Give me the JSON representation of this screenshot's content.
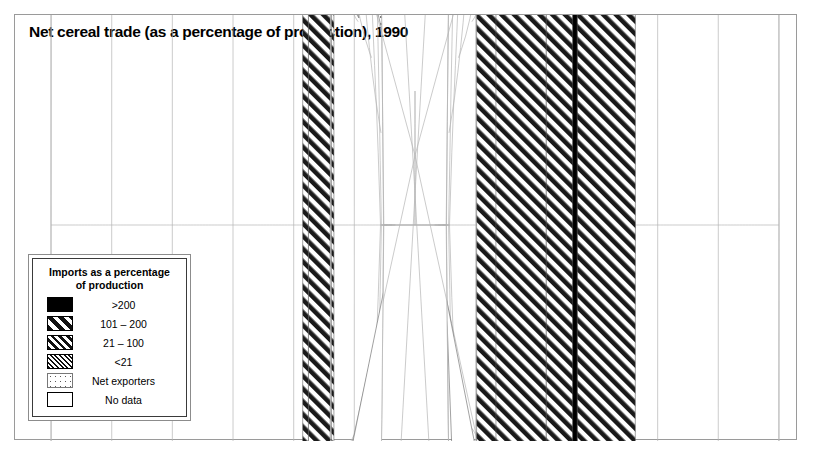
{
  "title": "Net cereal trade (as a percentage of production), 1990",
  "legend": {
    "heading_line1": "Imports as a percentage",
    "heading_line2": "of production",
    "items": [
      {
        "label": ">200",
        "pattern": "solid"
      },
      {
        "label": "101 – 200",
        "pattern": "hatch-wide"
      },
      {
        "label": "21 – 100",
        "pattern": "hatch-med"
      },
      {
        "label": "<21",
        "pattern": "hatch-fine"
      },
      {
        "label": "Net exporters",
        "pattern": "dots"
      },
      {
        "label": "No data",
        "pattern": "none"
      }
    ]
  },
  "map": {
    "projection": "van-der-grinten",
    "graticule_spacing_deg": 30,
    "colors": {
      "ink": "#000000",
      "graticule": "#b4b4b4",
      "coast": "#555555",
      "background": "#ffffff"
    },
    "regions": [
      {
        "name": "canada",
        "class": "dots"
      },
      {
        "name": "united-states",
        "class": "dots"
      },
      {
        "name": "greenland",
        "class": "none"
      },
      {
        "name": "mexico",
        "class": "hatch-wide"
      },
      {
        "name": "central-america",
        "class": "hatch-wide"
      },
      {
        "name": "cuba",
        "class": "solid"
      },
      {
        "name": "caribbean",
        "class": "solid"
      },
      {
        "name": "brazil",
        "class": "hatch-wide"
      },
      {
        "name": "northern-south-america",
        "class": "hatch-wide"
      },
      {
        "name": "argentina",
        "class": "dots"
      },
      {
        "name": "chile",
        "class": "hatch-fine"
      },
      {
        "name": "western-europe",
        "class": "dots"
      },
      {
        "name": "eastern-europe",
        "class": "hatch-wide"
      },
      {
        "name": "russia",
        "class": "hatch-wide"
      },
      {
        "name": "algeria",
        "class": "solid"
      },
      {
        "name": "libya",
        "class": "solid"
      },
      {
        "name": "egypt",
        "class": "solid"
      },
      {
        "name": "west-africa",
        "class": "hatch-wide"
      },
      {
        "name": "central-africa",
        "class": "hatch-wide"
      },
      {
        "name": "east-africa",
        "class": "hatch-wide"
      },
      {
        "name": "southern-africa",
        "class": "hatch-wide"
      },
      {
        "name": "south-africa",
        "class": "none"
      },
      {
        "name": "gabon-congo",
        "class": "solid"
      },
      {
        "name": "saudi-arabia",
        "class": "solid"
      },
      {
        "name": "middle-east",
        "class": "hatch-wide"
      },
      {
        "name": "madagascar",
        "class": "hatch-wide"
      },
      {
        "name": "india",
        "class": "dots"
      },
      {
        "name": "china",
        "class": "hatch-wide"
      },
      {
        "name": "southeast-asia",
        "class": "dots"
      },
      {
        "name": "indonesia",
        "class": "hatch-wide"
      },
      {
        "name": "japan",
        "class": "solid"
      },
      {
        "name": "korea",
        "class": "solid"
      },
      {
        "name": "australia",
        "class": "dots"
      },
      {
        "name": "new-zealand",
        "class": "solid"
      },
      {
        "name": "antarctica",
        "class": "none"
      }
    ]
  }
}
